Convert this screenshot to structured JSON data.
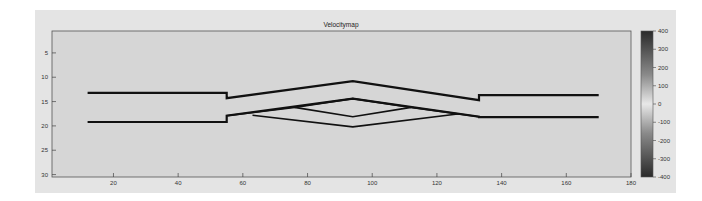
{
  "chart_data": {
    "type": "heatmap",
    "title": "Velocitymap",
    "xlabel": "",
    "ylabel": "",
    "xlim": [
      1,
      180
    ],
    "ylim": [
      30.5,
      0.5
    ],
    "y_reversed": true,
    "xticks": [
      20,
      40,
      60,
      80,
      100,
      120,
      140,
      160,
      180
    ],
    "yticks": [
      5,
      10,
      15,
      20,
      25,
      30
    ],
    "grid": false,
    "background_value": 0,
    "colorbar": {
      "ticks": [
        400,
        300,
        200,
        100,
        0,
        -100,
        -200,
        -300,
        -400
      ],
      "range": [
        -400,
        400
      ],
      "colormap": "gray (dark at extremes, light at 0)"
    },
    "lines": [
      {
        "name": "upper-channel-wall",
        "points": [
          [
            12,
            13.2
          ],
          [
            55,
            13.2
          ],
          [
            55,
            14.3
          ],
          [
            94,
            10.8
          ],
          [
            133,
            14.7
          ],
          [
            133,
            13.7
          ],
          [
            170,
            13.7
          ]
        ]
      },
      {
        "name": "lower-channel-wall",
        "points": [
          [
            12,
            19.2
          ],
          [
            55,
            19.2
          ],
          [
            55,
            17.9
          ],
          [
            94,
            14.4
          ],
          [
            133,
            18.1
          ],
          [
            133,
            18.2
          ],
          [
            170,
            18.2
          ]
        ]
      },
      {
        "name": "inner-diamond-lower",
        "points": [
          [
            76,
            16.2
          ],
          [
            94,
            18.1
          ],
          [
            112,
            16.2
          ]
        ]
      },
      {
        "name": "outer-diamond",
        "points": [
          [
            63,
            17.8
          ],
          [
            94,
            20.2
          ],
          [
            127,
            17.5
          ]
        ]
      },
      {
        "name": "inner-cross-line",
        "points": [
          [
            55,
            17.9
          ],
          [
            76,
            16.2
          ],
          [
            94,
            14.4
          ],
          [
            112,
            16.2
          ],
          [
            133,
            18.1
          ]
        ]
      }
    ]
  }
}
